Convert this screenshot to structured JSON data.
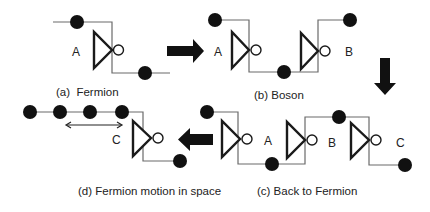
{
  "colors": {
    "wire": "#6a6a6a",
    "gate_outline": "#1a1a1a",
    "dot": "#111111",
    "arrow": "#111111",
    "background": "#ffffff"
  },
  "panels": {
    "a": {
      "caption": "(a)  Fermion",
      "gates": [
        {
          "label": "A"
        }
      ]
    },
    "b": {
      "caption": "(b) Boson",
      "gates": [
        {
          "label": "A"
        },
        {
          "label": "B"
        }
      ]
    },
    "c": {
      "caption": "(c) Back to Fermion",
      "gates": [
        {
          "label": "A"
        },
        {
          "label": "B"
        },
        {
          "label": "C"
        }
      ]
    },
    "d": {
      "caption": "(d) Fermion motion in space",
      "gates": [
        {
          "label": "C"
        }
      ],
      "dot_count": 4,
      "motion_arrow": "double-headed-arrow"
    }
  },
  "flow_arrows": [
    {
      "from": "a",
      "to": "b",
      "direction": "right"
    },
    {
      "from": "b",
      "to": "c",
      "direction": "down"
    },
    {
      "from": "c",
      "to": "d",
      "direction": "left"
    }
  ]
}
